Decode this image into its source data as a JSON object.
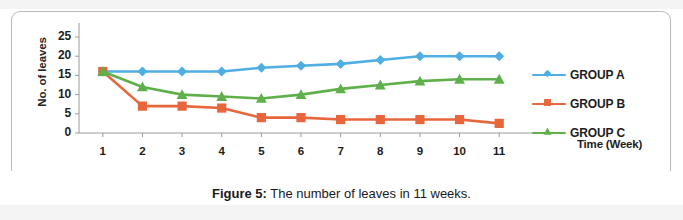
{
  "caption": {
    "label": "Figure 5:",
    "text": "The number of leaves in 11 weeks."
  },
  "chart_data": {
    "type": "line",
    "title": "",
    "xlabel": "Time (Week)",
    "ylabel": "No. of leaves",
    "x": [
      1,
      2,
      3,
      4,
      5,
      6,
      7,
      8,
      9,
      10,
      11
    ],
    "categories": [
      "1",
      "2",
      "3",
      "4",
      "5",
      "6",
      "7",
      "8",
      "9",
      "10",
      "11"
    ],
    "xlim": [
      0.4,
      11.6
    ],
    "ylim": [
      0,
      25
    ],
    "y_ticks": [
      0,
      5,
      10,
      15,
      20,
      25
    ],
    "y_tick_labels": [
      "0",
      "5",
      "10",
      "15",
      "20",
      "25"
    ],
    "grid": false,
    "legend_position": "right",
    "series": [
      {
        "name": "GROUP A",
        "color": "#4FAEE2",
        "marker": "diamond",
        "values": [
          16,
          16,
          16,
          16,
          17,
          17.5,
          18,
          19,
          20,
          20,
          20
        ]
      },
      {
        "name": "GROUP B",
        "color": "#E8663C",
        "marker": "square",
        "values": [
          16,
          7,
          7,
          6.5,
          4,
          4,
          3.5,
          3.5,
          3.5,
          3.5,
          2.5
        ]
      },
      {
        "name": "GROUP C",
        "color": "#5FB04A",
        "marker": "triangle",
        "values": [
          16,
          12,
          10,
          9.5,
          9,
          10,
          11.5,
          12.5,
          13.5,
          14,
          14
        ]
      }
    ]
  },
  "colors": {
    "group_a": "#4FAEE2",
    "group_b": "#E8663C",
    "group_c": "#5FB04A",
    "axis": "#9a9a9a",
    "text": "#1d1d1d",
    "frame": "#b9b9b9"
  }
}
